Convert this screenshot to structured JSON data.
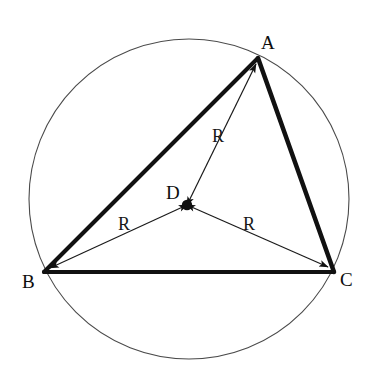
{
  "figure": {
    "background_color": "#ffffff",
    "stroke_color": "#111111",
    "circle_stroke_color": "#444444",
    "width": 374,
    "height": 379
  },
  "circle": {
    "name": "circumcircle",
    "center_x": 189,
    "center_y": 199,
    "radius": 160,
    "stroke_width": 1.1
  },
  "center_point": {
    "label": "D",
    "x": 187,
    "y": 205,
    "dot_radius": 5,
    "label_x": 166,
    "label_y": 183
  },
  "vertices": [
    {
      "label": "A",
      "x": 258,
      "y": 58,
      "label_x": 261,
      "label_y": 33
    },
    {
      "label": "B",
      "x": 44,
      "y": 272,
      "label_x": 22,
      "label_y": 272
    },
    {
      "label": "C",
      "x": 334,
      "y": 272,
      "label_x": 340,
      "label_y": 270
    }
  ],
  "triangle_sides": [
    {
      "name": "side-AB",
      "from": "A",
      "to": "B",
      "stroke_width": 4
    },
    {
      "name": "side-BC",
      "from": "B",
      "to": "C",
      "stroke_width": 4
    },
    {
      "name": "side-CA",
      "from": "C",
      "to": "A",
      "stroke_width": 4
    }
  ],
  "radii": [
    {
      "name": "radius-DA",
      "label": "R",
      "from_x": 187,
      "from_y": 205,
      "to_x": 256,
      "to_y": 64,
      "label_x": 212,
      "label_y": 127,
      "stroke_width": 1.2
    },
    {
      "name": "radius-DB",
      "label": "R",
      "from_x": 187,
      "from_y": 205,
      "to_x": 50,
      "to_y": 268,
      "label_x": 118,
      "label_y": 215,
      "stroke_width": 1.2
    },
    {
      "name": "radius-DC",
      "label": "R",
      "from_x": 187,
      "from_y": 205,
      "to_x": 328,
      "to_y": 267,
      "label_x": 243,
      "label_y": 215,
      "stroke_width": 1.2
    }
  ],
  "legend": {
    "radius_symbol": "R",
    "center_symbol": "D",
    "vertex_symbols": "A, B, C"
  }
}
